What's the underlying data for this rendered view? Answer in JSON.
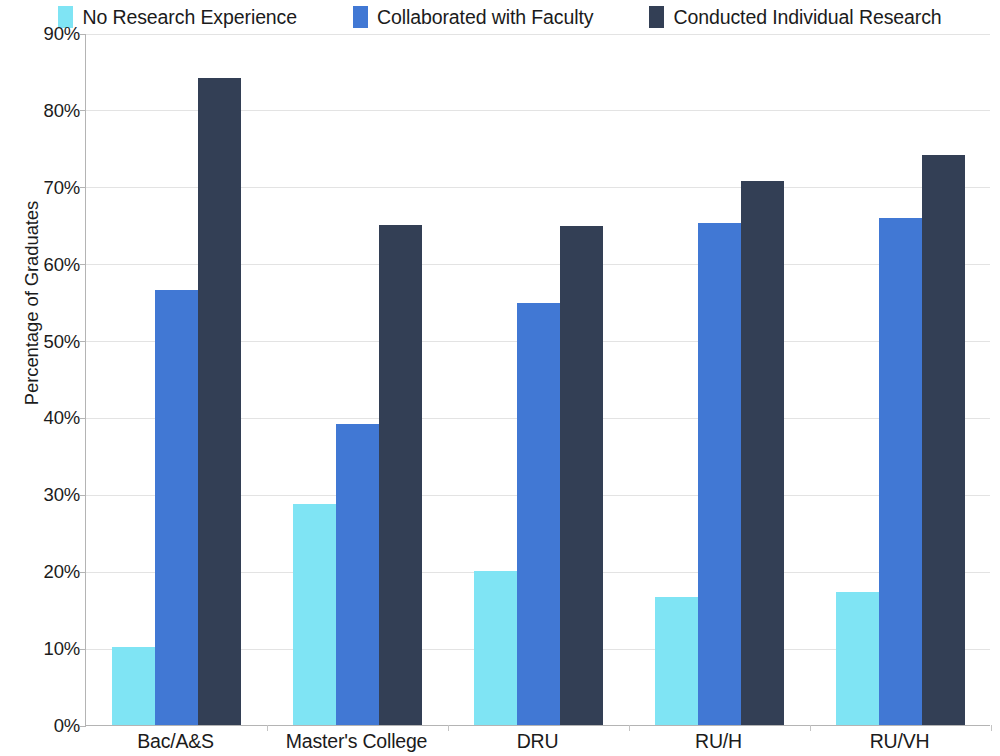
{
  "chart_data": {
    "type": "bar",
    "title": "",
    "subtitle": "",
    "xlabel": "",
    "ylabel": "Percentage of Graduates",
    "categories": [
      "Bac/A&S",
      "Master's College",
      "DRU",
      "RU/H",
      "RU/VH"
    ],
    "series": [
      {
        "name": "No Research Experience",
        "color": "#7fe4f4",
        "values": [
          10.1,
          28.8,
          20.0,
          16.6,
          17.3
        ]
      },
      {
        "name": "Collaborated with Faculty",
        "color": "#4178d4",
        "values": [
          56.6,
          39.1,
          54.9,
          65.3,
          66.0
        ]
      },
      {
        "name": "Conducted Individual Research",
        "color": "#333f55",
        "values": [
          84.2,
          65.0,
          64.9,
          70.8,
          74.1
        ]
      }
    ],
    "ylim": [
      0,
      90
    ],
    "ytick_values": [
      0,
      10,
      20,
      30,
      40,
      50,
      60,
      70,
      80,
      90
    ],
    "ytick_labels": [
      "0%",
      "10%",
      "20%",
      "30%",
      "40%",
      "50%",
      "60%",
      "70%",
      "80%",
      "90%"
    ],
    "grid": true,
    "grid_axis": "y",
    "legend_position": "top",
    "grid_color": "#e3e3e3",
    "axis_color": "#b4b4b4",
    "background_color": "#ffffff",
    "text_color": "#1b1b1b"
  },
  "legend": {
    "items": [
      {
        "label": "No Research Experience",
        "color": "#7fe4f4"
      },
      {
        "label": "Collaborated with Faculty",
        "color": "#4178d4"
      },
      {
        "label": "Conducted Individual Research",
        "color": "#333f55"
      }
    ]
  },
  "axes": {
    "y_title": "Percentage of Graduates",
    "y_labels": [
      "90%",
      "80%",
      "70%",
      "60%",
      "50%",
      "40%",
      "30%",
      "20%",
      "10%",
      "0%"
    ],
    "x_labels": [
      "Bac/A&S",
      "Master's College",
      "DRU",
      "RU/H",
      "RU/VH"
    ]
  }
}
